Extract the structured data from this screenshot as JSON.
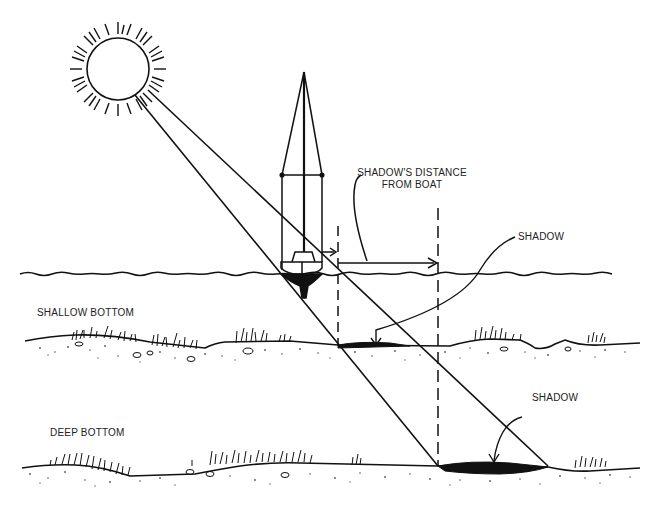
{
  "diagram": {
    "type": "illustration",
    "labels": {
      "distance_line1": "SHADOW'S DISTANCE",
      "distance_line2": "FROM BOAT",
      "shadow_shallow": "SHADOW",
      "shadow_deep": "SHADOW",
      "shallow_bottom": "SHALLOW BOTTOM",
      "deep_bottom": "DEEP BOTTOM"
    },
    "colors": {
      "ink": "#111111",
      "paper": "#ffffff",
      "stipple": "#555555"
    }
  }
}
